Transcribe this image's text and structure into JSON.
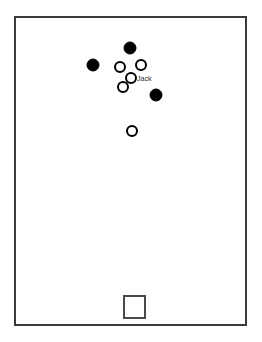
{
  "canvas": {
    "width": 262,
    "height": 342,
    "background_color": "#ffffff"
  },
  "room": {
    "label": "room-boundary",
    "x": 15,
    "y": 17,
    "width": 231,
    "height": 308,
    "stroke_color": "#3a3a3a",
    "fill_color": "#ffffff",
    "stroke_width": 2
  },
  "exit": {
    "label": "door-marker",
    "x": 124,
    "y": 296,
    "width": 21,
    "height": 22,
    "stroke_color": "#4a4a4a",
    "fill_color": "#ffffff"
  },
  "legend_colors": {
    "filled_marker": "#000000",
    "open_marker_fill": "#ffffff",
    "open_marker_stroke": "#000000",
    "label_text": "#2b2b2b"
  },
  "chart_data": {
    "type": "scatter",
    "title": "",
    "xlabel": "",
    "ylabel": "",
    "xlim": [
      0,
      262
    ],
    "ylim": [
      0,
      342
    ],
    "grid": false,
    "legend": "none",
    "series": [
      {
        "name": "filled",
        "marker": "filled-circle",
        "color": "#000000",
        "radius": 6,
        "points": [
          {
            "x": 130,
            "y": 48,
            "label": ""
          },
          {
            "x": 93,
            "y": 65,
            "label": ""
          },
          {
            "x": 156,
            "y": 95,
            "label": ""
          }
        ]
      },
      {
        "name": "open",
        "marker": "open-circle",
        "color": "#ffffff",
        "stroke": "#000000",
        "radius": 5,
        "points": [
          {
            "x": 120,
            "y": 67,
            "label": ""
          },
          {
            "x": 141,
            "y": 65,
            "label": ""
          },
          {
            "x": 131,
            "y": 78,
            "label": "Jack"
          },
          {
            "x": 123,
            "y": 87,
            "label": ""
          },
          {
            "x": 132,
            "y": 131,
            "label": ""
          }
        ]
      }
    ],
    "annotations": [
      {
        "text": "Jack",
        "x": 137,
        "y": 79
      }
    ]
  }
}
